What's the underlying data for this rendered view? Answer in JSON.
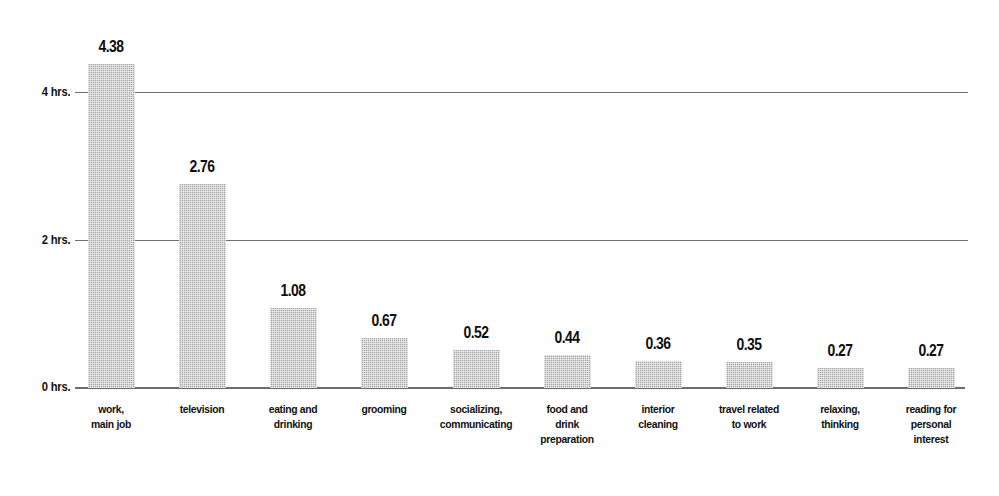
{
  "chart_data": {
    "type": "bar",
    "title": "",
    "subtitle": "",
    "xlabel": "",
    "ylabel": "",
    "ylim": [
      0,
      4.8
    ],
    "grid": "horizontal gridlines at 2 hrs. and 4 hrs.",
    "legend": "none",
    "units": "hours",
    "categories": [
      "work, main job",
      "television",
      "eating and drinking",
      "grooming",
      "socializing, communicating",
      "food and drink preparation",
      "interior cleaning",
      "travel related to work",
      "relaxing, thinking",
      "reading for personal interest"
    ],
    "category_lines": [
      [
        "work,",
        "main job"
      ],
      [
        "television"
      ],
      [
        "eating and",
        "drinking"
      ],
      [
        "grooming"
      ],
      [
        "socializing,",
        "communicating"
      ],
      [
        "food and",
        "drink",
        "preparation"
      ],
      [
        "interior",
        "cleaning"
      ],
      [
        "travel related",
        "to work"
      ],
      [
        "relaxing,",
        "thinking"
      ],
      [
        "reading for",
        "personal",
        "interest"
      ]
    ],
    "values": [
      4.38,
      2.76,
      1.08,
      0.67,
      0.52,
      0.44,
      0.36,
      0.35,
      0.27,
      0.27
    ],
    "value_labels": [
      "4.38",
      "2.76",
      "1.08",
      "0.67",
      "0.52",
      "0.44",
      "0.36",
      "0.35",
      "0.27",
      "0.27"
    ],
    "yticks": [
      0,
      2,
      4
    ],
    "ytick_labels": [
      "0 hrs.",
      "2 hrs.",
      "4 hrs."
    ],
    "colors": {
      "bar_fill": "#a8a8a8",
      "gridline": "#6e6e6e",
      "axis": "#6b6b6b",
      "text": "#111111",
      "background": "#ffffff"
    }
  }
}
